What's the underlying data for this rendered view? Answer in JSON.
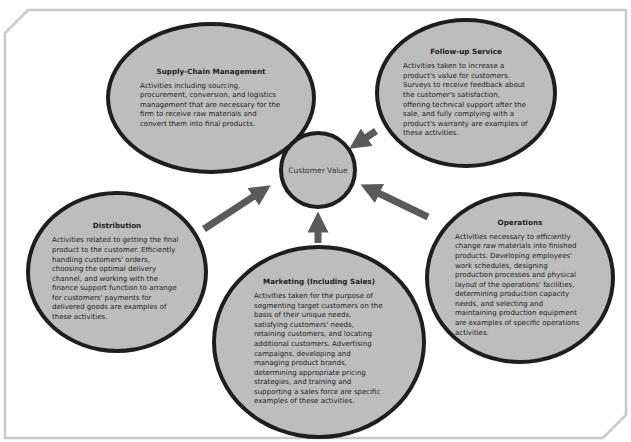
{
  "diagram": {
    "center": {
      "label": "Customer Value"
    },
    "nodes": [
      {
        "id": "supply-chain",
        "title": "Supply-Chain Management",
        "description": "Activities including sourcing, procurement, conversion, and logistics management that are necessary for the firm to receive raw materials and convert them into final products."
      },
      {
        "id": "follow-up",
        "title": "Follow-up Service",
        "description": "Activities taken to increase a product's value for customers. Surveys to receive feedback about the customer's satisfaction, offering technical support after the sale, and fully complying with a product's warranty are examples of these activities."
      },
      {
        "id": "distribution",
        "title": "Distribution",
        "description": "Activities related to getting the final product to the customer. Efficiently handling customers' orders, choosing the optimal delivery channel, and working with the finance support function to arrange for customers' payments for delivered goods are examples of these activities."
      },
      {
        "id": "marketing",
        "title": "Marketing (Including Sales)",
        "description": "Activities taken for the purpose of segmenting target customers on the basis of their unique needs, satisfying customers' needs, retaining customers, and locating additional customers. Advertising campaigns, developing and managing product brands, determining appropriate pricing strategies, and training and supporting a sales force are specific examples of these activities."
      },
      {
        "id": "operations",
        "title": "Operations",
        "description": "Activities necessary to efficiently change raw materials into finished products. Developing employees' work schedules, designing production processes and physical layout of the operations' facilities, determining production capacity needs, and selecting and maintaining production equipment are examples of specific operations activities."
      }
    ],
    "edges": [
      {
        "from": "supply-chain",
        "to": "customer-value"
      },
      {
        "from": "follow-up",
        "to": "customer-value"
      },
      {
        "from": "distribution",
        "to": "customer-value"
      },
      {
        "from": "marketing",
        "to": "customer-value"
      },
      {
        "from": "operations",
        "to": "customer-value"
      }
    ],
    "colors": {
      "node_fill": "#bdbdbd",
      "node_border": "#1e1e1e",
      "arrow": "#5a5a5a",
      "frame": "#c8c8c8"
    }
  }
}
